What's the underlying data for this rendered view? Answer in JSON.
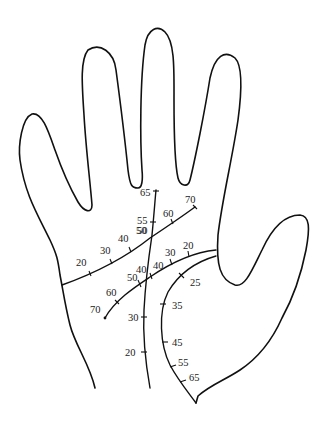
{
  "diagram": {
    "colors": {
      "stroke": "#111111",
      "label": "#222222",
      "background": "#ffffff"
    },
    "lines": {
      "heart_line": {
        "markers": [
          "20",
          "30",
          "40",
          "50",
          "60",
          "70"
        ]
      },
      "head_line": {
        "markers": [
          "20",
          "30",
          "40",
          "50",
          "60",
          "70"
        ]
      },
      "life_line": {
        "markers": [
          "25",
          "35",
          "45",
          "55",
          "65"
        ]
      },
      "fate_line": {
        "markers": [
          "20",
          "30",
          "40",
          "50",
          "55",
          "65"
        ]
      }
    }
  }
}
